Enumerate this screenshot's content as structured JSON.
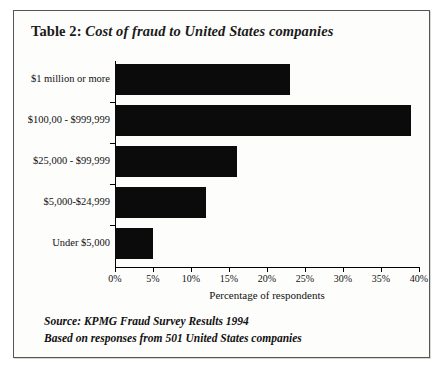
{
  "figure": {
    "title_lead": "Table 2:",
    "title_main": "Cost of fraud to United States companies",
    "source_line": "Source: KPMG Fraud Survey Results 1994",
    "basis_line": "Based on responses from 501 United States companies"
  },
  "chart_data": {
    "type": "bar",
    "orientation": "horizontal",
    "title": "Cost of fraud to United States companies",
    "categories": [
      "$1 million or more",
      "$100,00 - $999,999",
      "$25,000 - $99,999",
      "$5,000-$24,999",
      "Under $5,000"
    ],
    "values": [
      23,
      39,
      16,
      12,
      5
    ],
    "series": [
      {
        "name": "Percentage of respondents",
        "values": [
          23,
          39,
          16,
          12,
          5
        ]
      }
    ],
    "xlabel": "Percentage of respondents",
    "ylabel": "",
    "xlim": [
      0,
      40
    ],
    "xtick_labels": [
      "0%",
      "5%",
      "10%",
      "15%",
      "20%",
      "25%",
      "30%",
      "35%",
      "40%"
    ],
    "xtick_values": [
      0,
      5,
      10,
      15,
      20,
      25,
      30,
      35,
      40
    ],
    "grid": false,
    "legend": false,
    "bar_color": "#0b0b0b"
  }
}
